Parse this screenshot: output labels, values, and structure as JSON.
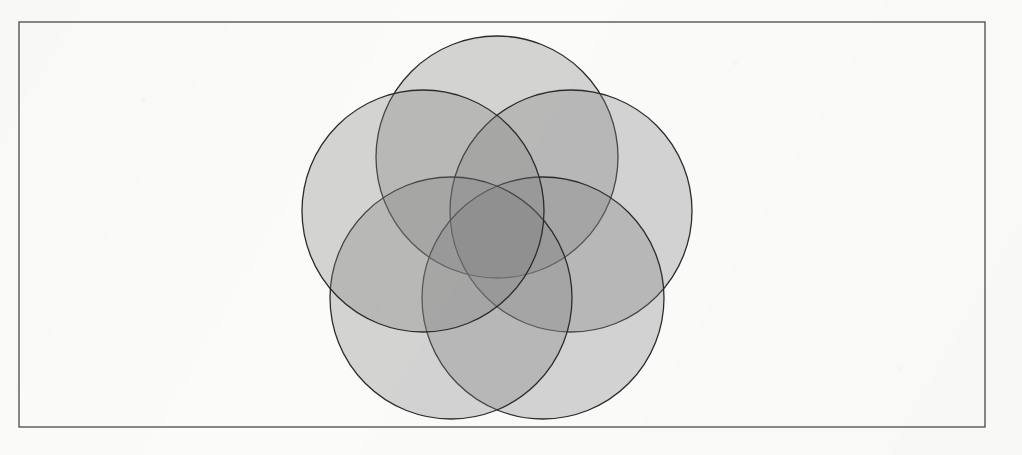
{
  "page": {
    "width": 1022,
    "height": 455,
    "background_color": "#fbfbfa",
    "medium": "scanned-page"
  },
  "frame": {
    "name": "figure-border",
    "x": 19,
    "y": 22,
    "width": 966,
    "height": 405,
    "stroke_color": "#3b3b3b",
    "stroke_width": 1.2,
    "fill": "none"
  },
  "figure": {
    "title": "",
    "caption": "",
    "type": "five-circle-rosette",
    "description": "Five equal overlapping circles arranged with five-fold rotational symmetry, filled with a translucent gray so overlaps darken; the five-fold core forms a dark five-pointed star.",
    "center": {
      "x": 497,
      "y": 235
    },
    "circle_radius": 121,
    "center_offset_radius": 78,
    "symmetry_order": 5,
    "fill_color": "#808080",
    "fill_opacity": 0.32,
    "stroke_color": "#2b2b2b",
    "stroke_width": 1.3,
    "overlap_shades": {
      "one_layer": "#dcdcdc",
      "two_layer": "#9e9e9e",
      "three_layer": "#6d6d6d",
      "four_layer": "#4a4a4a",
      "five_layer": "#2e2e2e"
    },
    "circles": [
      {
        "id": "circle-top",
        "label": "A",
        "angle_deg": -90,
        "cx": 497,
        "cy": 157,
        "r": 121
      },
      {
        "id": "circle-upper-right",
        "label": "B",
        "angle_deg": -18,
        "cx": 571,
        "cy": 211,
        "r": 121
      },
      {
        "id": "circle-lower-right",
        "label": "C",
        "angle_deg": 54,
        "cx": 543,
        "cy": 298,
        "r": 121
      },
      {
        "id": "circle-lower-left",
        "label": "D",
        "angle_deg": 126,
        "cx": 451,
        "cy": 298,
        "r": 121
      },
      {
        "id": "circle-upper-left",
        "label": "E",
        "angle_deg": 198,
        "cx": 423,
        "cy": 211,
        "r": 121
      }
    ],
    "bounds": {
      "left": 287,
      "top": 36,
      "right": 689,
      "bottom": 415
    }
  }
}
